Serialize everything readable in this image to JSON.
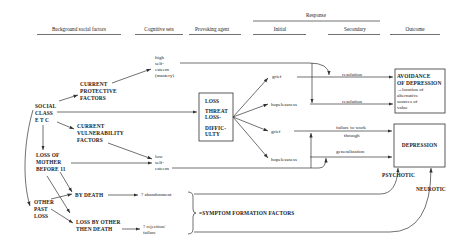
{
  "headers": {
    "background": "Background social factors",
    "cognitive": "Cognitive sets",
    "provoking": "Provoking agent",
    "response": "Response",
    "initial": "Initial",
    "secondary": "Secondary",
    "outcome": "Outcome"
  },
  "background": {
    "social_class": [
      "SOCIAL",
      "CLASS",
      "E T C"
    ],
    "protective": [
      "CURRENT",
      "PROTECTIVE",
      "FACTORS"
    ],
    "vulnerability": [
      "CURRENT",
      "VULNERABILITY",
      "FACTORS"
    ],
    "loss_mother": [
      "LOSS OF",
      "MOTHER",
      "BEFORE 11"
    ],
    "other_loss": [
      "OTHER",
      "PAST",
      "LOSS"
    ],
    "by_death": "BY DEATH",
    "loss_other": [
      "LOSS BY OTHER",
      "THEN DEATH"
    ]
  },
  "cognitive": {
    "high": [
      "high",
      "self-",
      "esteem",
      "(mastery)"
    ],
    "low": [
      "low",
      "self-",
      "esteem"
    ],
    "abandonment": "? abandonment",
    "rejection": [
      "? rejection/",
      "failure"
    ]
  },
  "provoking": {
    "box": [
      "LOSS",
      "THREAT",
      "LOSS-",
      "DIFFIC-",
      "ULTY"
    ]
  },
  "response": {
    "initial": [
      "grief",
      "hopelessness",
      "grief",
      "hopelessness"
    ],
    "secondary": [
      "resolution",
      "resolution",
      "failure to work",
      "through",
      "generalization"
    ]
  },
  "outcome": {
    "avoidance": [
      "AVOIDANCE",
      "OF DEPRESSION",
      "→location of",
      "alternative",
      "sources of",
      "value"
    ],
    "depression": "DEPRESSION",
    "psychotic": "PSYCHOTIC",
    "neurotic": "NEUROTIC"
  },
  "symptom": "=SYMPTOM FORMATION FACTORS"
}
